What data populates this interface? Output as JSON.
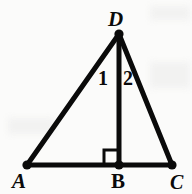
{
  "figure": {
    "kind": "geometry-diagram",
    "background_color": "#fbfbfa",
    "stroke_color": "#0a0a0a",
    "stroke_width": 5,
    "canvas": {
      "width": 192,
      "height": 194
    },
    "points": {
      "A": {
        "x": 27,
        "y": 165
      },
      "B": {
        "x": 119,
        "y": 165
      },
      "C": {
        "x": 172,
        "y": 165
      },
      "D": {
        "x": 119,
        "y": 34
      }
    },
    "segments": [
      {
        "name": "AD",
        "from": "A",
        "to": "D"
      },
      {
        "name": "DC",
        "from": "D",
        "to": "C"
      },
      {
        "name": "AC",
        "from": "A",
        "to": "C"
      },
      {
        "name": "DB",
        "from": "D",
        "to": "B"
      }
    ],
    "vertex_dots": [
      "A",
      "B",
      "C",
      "D"
    ],
    "right_angle": {
      "at": "B",
      "size": 15,
      "orientation": "upper-left",
      "marker": "square"
    },
    "labels": {
      "D": "D",
      "A": "A",
      "B": "B",
      "C": "C",
      "angle_1": "1",
      "angle_2": "2"
    }
  }
}
